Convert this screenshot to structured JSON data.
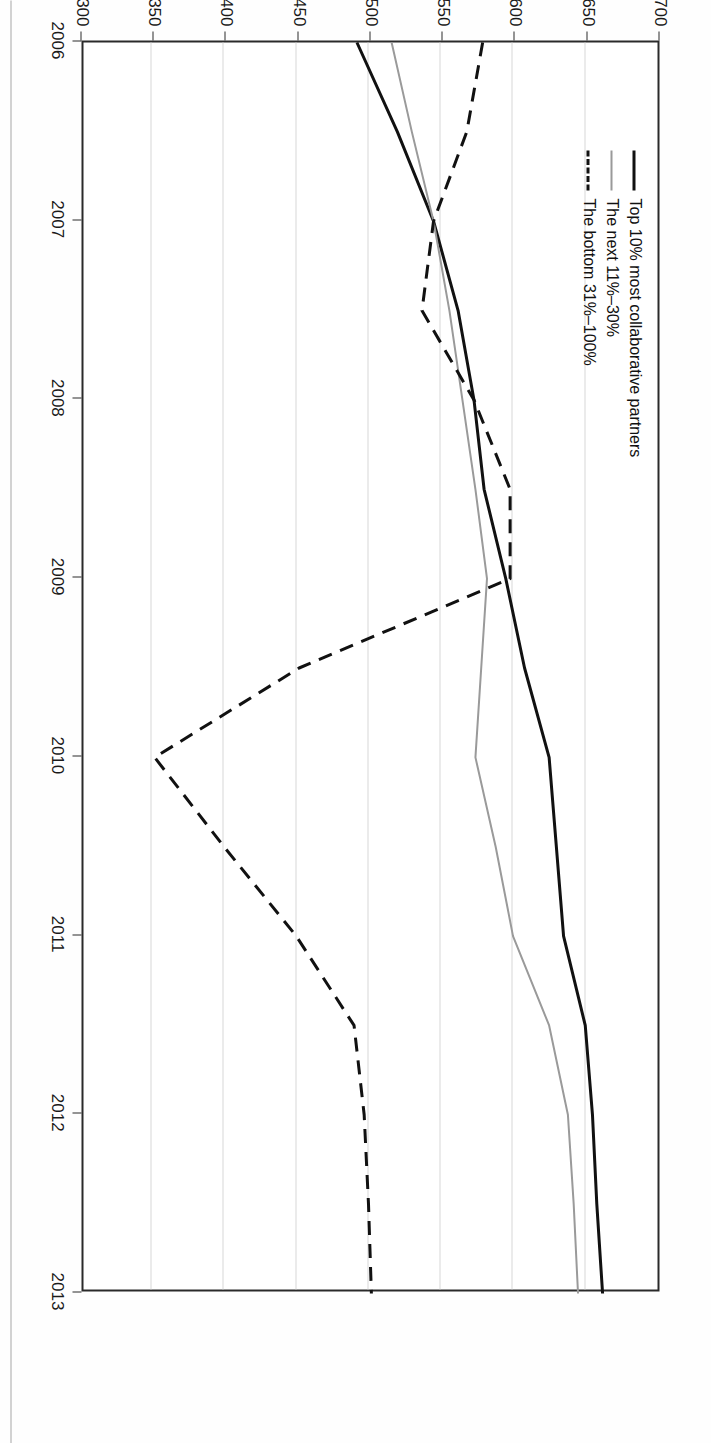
{
  "chart_data": {
    "type": "line",
    "title": "",
    "xlabel": "",
    "ylabel": "Revenue generated, USD thousands",
    "xlim": [
      2006,
      2013
    ],
    "ylim": [
      300,
      700
    ],
    "ytick_step": 50,
    "grid": "value-axis gridlines only",
    "legend_position": "top-left inside plot",
    "x": [
      2006,
      2006.5,
      2007,
      2007.5,
      2008,
      2008.5,
      2009,
      2009.5,
      2010,
      2010.5,
      2011,
      2011.5,
      2012,
      2012.5,
      2013
    ],
    "xticks": [
      "2006",
      "2007",
      "2008",
      "2009",
      "2010",
      "2011",
      "2012",
      "2013"
    ],
    "yticks": [
      "$700",
      "$650",
      "$600",
      "$550",
      "$500",
      "$450",
      "$400",
      "$350",
      "$300"
    ],
    "ytick_values": [
      700,
      650,
      600,
      550,
      500,
      450,
      400,
      350,
      300
    ],
    "series": [
      {
        "name": "Top 10% most collaborative partners",
        "color": "#111111",
        "style": "solid",
        "width": 3,
        "values": [
          492,
          520,
          545,
          562,
          573,
          580,
          595,
          608,
          625,
          630,
          635,
          650,
          655,
          658,
          662
        ]
      },
      {
        "name": "The next 11%–30%",
        "color": "#9a9a9a",
        "style": "solid",
        "width": 2,
        "values": [
          516,
          530,
          545,
          556,
          565,
          574,
          582,
          578,
          574,
          588,
          600,
          625,
          638,
          642,
          645
        ]
      },
      {
        "name": "The bottom 31%–100%",
        "color": "#111111",
        "style": "dashed",
        "width": 3,
        "values": [
          579,
          568,
          545,
          537,
          573,
          598,
          598,
          452,
          352,
          400,
          450,
          490,
          497,
          500,
          502
        ]
      }
    ]
  },
  "legend": {
    "items": [
      {
        "label": "Top 10% most collaborative partners",
        "swatch": "solid-black"
      },
      {
        "label": "The next 11%–30%",
        "swatch": "solid-gray"
      },
      {
        "label": "The bottom 31%–100%",
        "swatch": "dashed-black"
      }
    ]
  },
  "axes": {
    "value_axis_title": "Revenue generated, USD thousands"
  }
}
